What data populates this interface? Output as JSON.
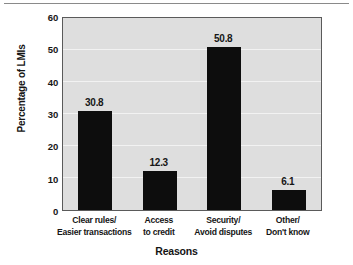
{
  "chart_data": {
    "type": "bar",
    "title": "",
    "xlabel": "Reasons",
    "ylabel": "Percentage of LMIs",
    "categories": [
      "Clear rules/ Easier transactions",
      "Access to credit",
      "Security/ Avoid disputes",
      "Other/ Don't know"
    ],
    "category_lines": [
      [
        "Clear rules/",
        "Easier transactions"
      ],
      [
        "Access",
        "to credit"
      ],
      [
        "Security/",
        "Avoid disputes"
      ],
      [
        "Other/",
        "Don't know"
      ]
    ],
    "values": [
      30.8,
      12.3,
      50.8,
      6.1
    ],
    "value_labels": [
      "30.8",
      "12.3",
      "50.8",
      "6.1"
    ],
    "ylim": [
      0,
      60
    ],
    "yticks": [
      60,
      50,
      40,
      30,
      20,
      10,
      0
    ],
    "ytick_labels": [
      "60",
      "50",
      "40",
      "30",
      "20",
      "10",
      "0"
    ],
    "grid": true,
    "legend": "none",
    "colors": {
      "bar": "#0d0d0d",
      "plot_background": "#dedede",
      "gridline": "#f2f2f2",
      "axis_border": "#5a5a5a",
      "text": "#161616",
      "figure_background": "#ffffff"
    }
  }
}
